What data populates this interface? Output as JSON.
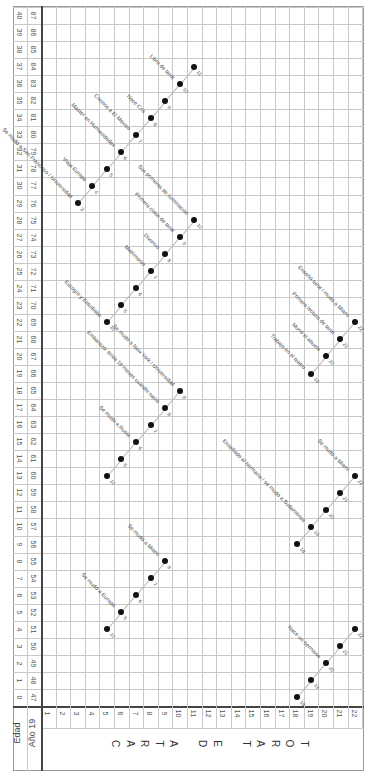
{
  "header": {
    "edad_label": "Edad",
    "ano_label": "Año 19",
    "title_letters": [
      "C",
      "A",
      "R",
      "T",
      "A",
      "",
      "D",
      "E",
      "",
      "T",
      "A",
      "R",
      "O",
      "T"
    ]
  },
  "ages": [
    0,
    1,
    2,
    3,
    4,
    5,
    6,
    7,
    8,
    9,
    10,
    11,
    12,
    13,
    14,
    15,
    16,
    17,
    18,
    19,
    20,
    21,
    22,
    23,
    24,
    25,
    26,
    27,
    28,
    29,
    30,
    31,
    32,
    33,
    34,
    35,
    36,
    37,
    38,
    39,
    40
  ],
  "years": [
    47,
    48,
    49,
    50,
    51,
    52,
    53,
    54,
    55,
    56,
    57,
    58,
    59,
    60,
    61,
    62,
    63,
    64,
    65,
    66,
    67,
    68,
    69,
    70,
    71,
    72,
    73,
    74,
    75,
    76,
    77,
    78,
    79,
    80,
    81,
    82,
    83,
    84,
    85,
    86,
    87
  ],
  "cards": [
    1,
    2,
    3,
    4,
    5,
    6,
    7,
    8,
    9,
    10,
    11,
    12,
    13,
    14,
    15,
    16,
    17,
    18,
    19,
    20,
    21,
    22
  ],
  "chart_data": {
    "type": "scatter",
    "xlabel": "Carta de Tarot (1-22)",
    "ylabel": "Edad / Año 19__",
    "series": [
      {
        "name": "A",
        "points": [
          {
            "card": 5,
            "age": 4,
            "num": "10"
          },
          {
            "card": 6,
            "age": 5,
            "num": "5"
          },
          {
            "card": 7,
            "age": 6,
            "num": "6"
          },
          {
            "card": 8,
            "age": 7,
            "num": "7"
          },
          {
            "card": 9,
            "age": 8,
            "num": "8"
          }
        ],
        "events": [
          {
            "at": 6,
            "text": "Se mudó a Europa"
          },
          {
            "at": 9,
            "text": "Se mudó a Miami"
          }
        ]
      },
      {
        "name": "B",
        "points": [
          {
            "card": 5,
            "age": 13,
            "num": "10"
          },
          {
            "card": 6,
            "age": 14,
            "num": "5"
          },
          {
            "card": 7,
            "age": 15,
            "num": "6"
          },
          {
            "card": 8,
            "age": 16,
            "num": "7"
          },
          {
            "card": 9,
            "age": 17,
            "num": "8"
          },
          {
            "card": 10,
            "age": 18,
            "num": "9"
          }
        ],
        "events": [
          {
            "at": 7,
            "text": "Se mudó a Rusia"
          },
          {
            "at": 9,
            "text": "Embarazo: tenía 18 meses cuando nació"
          },
          {
            "at": 10,
            "text": "Se mudó a New York / Universidad"
          }
        ]
      },
      {
        "name": "C",
        "points": [
          {
            "card": 5,
            "age": 22,
            "num": "10"
          },
          {
            "card": 6,
            "age": 23,
            "num": "5"
          },
          {
            "card": 7,
            "age": 24,
            "num": "6"
          },
          {
            "card": 8,
            "age": 25,
            "num": "7"
          },
          {
            "card": 9,
            "age": 26,
            "num": "8"
          },
          {
            "card": 10,
            "age": 27,
            "num": "9"
          },
          {
            "card": 11,
            "age": 28,
            "num": "10"
          }
        ],
        "events": [
          {
            "at": 5,
            "text": "Escogió y Estudiaba"
          },
          {
            "at": 8,
            "text": "Matrimonio"
          },
          {
            "at": 9,
            "text": "Divorcio"
          },
          {
            "at": 10,
            "text": "Primera clase de tarot"
          },
          {
            "at": 11,
            "text": "Sus primeros de iluminación"
          }
        ]
      },
      {
        "name": "D",
        "points": [
          {
            "card": 3,
            "age": 29,
            "num": "3"
          },
          {
            "card": 4,
            "age": 30,
            "num": "4"
          },
          {
            "card": 5,
            "age": 31,
            "num": "5"
          },
          {
            "card": 6,
            "age": 32,
            "num": "6"
          },
          {
            "card": 7,
            "age": 33,
            "num": "7"
          },
          {
            "card": 8,
            "age": 34,
            "num": "8"
          },
          {
            "card": 9,
            "age": 35,
            "num": "9"
          },
          {
            "card": 10,
            "age": 36,
            "num": "10"
          },
          {
            "card": 11,
            "age": 37,
            "num": "11"
          }
        ],
        "events": [
          {
            "at": 3,
            "text": "Se mudó a San Francisco / Universidad"
          },
          {
            "at": 4,
            "text": "Viaja Europa"
          },
          {
            "at": 6,
            "text": "Master en Humanidades"
          },
          {
            "at": 7,
            "text": "Conoce a El Mexico"
          },
          {
            "at": 8,
            "text": "Nace Cris"
          },
          {
            "at": 10,
            "text": "Libro de tarot"
          }
        ]
      },
      {
        "name": "E",
        "points": [
          {
            "card": 18,
            "age": 0,
            "num": "18"
          },
          {
            "card": 19,
            "age": 1,
            "num": "19"
          },
          {
            "card": 20,
            "age": 2,
            "num": "20"
          },
          {
            "card": 21,
            "age": 3,
            "num": "21"
          },
          {
            "card": 22,
            "age": 4,
            "num": "22"
          }
        ],
        "events": [
          {
            "at": 20,
            "text": "Nace un hermano"
          }
        ]
      },
      {
        "name": "F",
        "points": [
          {
            "card": 18,
            "age": 9,
            "num": "18"
          },
          {
            "card": 19,
            "age": 10,
            "num": "19"
          },
          {
            "card": 20,
            "age": 11,
            "num": "20"
          },
          {
            "card": 21,
            "age": 12,
            "num": "21"
          },
          {
            "card": 22,
            "age": 13,
            "num": "22"
          }
        ],
        "events": [
          {
            "at": 19,
            "text": "Enseñado al hermano / se mudó a Sudamérica"
          },
          {
            "at": 22,
            "text": "Se mudó a Miami"
          }
        ]
      },
      {
        "name": "G",
        "points": [
          {
            "card": 19,
            "age": 19,
            "num": "19"
          },
          {
            "card": 20,
            "age": 20,
            "num": "20"
          },
          {
            "card": 21,
            "age": 21,
            "num": "21"
          },
          {
            "card": 22,
            "age": 22,
            "num": "22"
          }
        ],
        "events": [
          {
            "at": 19,
            "text": "Trabajo en el teatro"
          },
          {
            "at": 20,
            "text": "Murió el abuelo"
          },
          {
            "at": 21,
            "text": "Primera lectura de tarot"
          },
          {
            "at": 22,
            "text": "Enseñó tarot / mudó a Miami"
          }
        ]
      }
    ],
    "x_range": [
      1,
      22
    ],
    "y_range": [
      0,
      40
    ],
    "grid": true
  }
}
